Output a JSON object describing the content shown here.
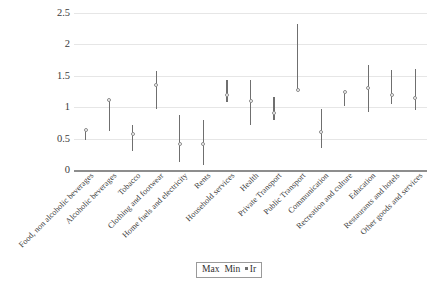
{
  "chart_data": {
    "type": "scatter",
    "title": "",
    "subtitle": "",
    "xlabel": "",
    "ylabel": "",
    "ylim": [
      0,
      2.5
    ],
    "ytick_labels": [
      "0",
      "0.5",
      "1",
      "1.5",
      "2",
      "2.5"
    ],
    "ytick_values": [
      0,
      0.5,
      1,
      1.5,
      2,
      2.5
    ],
    "grid": true,
    "legend_position": "bottom",
    "legend_entries": [
      "Max",
      "Min",
      "Ir"
    ],
    "categories": [
      "Food, non alcoholic beverages",
      "Alcoholic beverages",
      "Tobacco",
      "Clothing and footwear",
      "Home fuels and electricity",
      "Rents",
      "Household services",
      "Health",
      "Private Transport",
      "Public Transport",
      "Communication",
      "Recreation and culture",
      "Education",
      "Restaurants and hotels",
      "Other goods and services"
    ],
    "series": [
      {
        "name": "Max",
        "values": [
          0.66,
          1.12,
          0.71,
          1.58,
          0.87,
          0.79,
          1.43,
          1.44,
          1.16,
          2.32,
          0.97,
          1.26,
          1.67,
          1.59,
          1.61
        ]
      },
      {
        "name": "Min",
        "values": [
          0.47,
          0.62,
          0.31,
          0.97,
          0.12,
          0.08,
          1.08,
          0.72,
          0.79,
          1.27,
          0.35,
          1.02,
          0.93,
          1.05,
          0.95
        ]
      },
      {
        "name": "Ir",
        "values": [
          0.63,
          1.11,
          0.57,
          1.35,
          0.41,
          0.42,
          1.2,
          1.1,
          0.91,
          1.28,
          0.61,
          1.24,
          1.3,
          1.19,
          1.14
        ]
      }
    ]
  }
}
